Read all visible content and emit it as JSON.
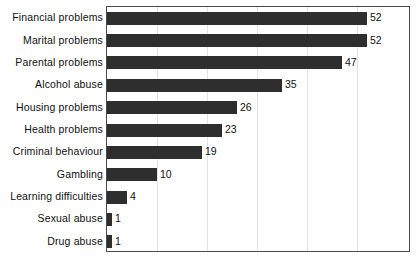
{
  "chart_data": {
    "type": "bar",
    "orientation": "horizontal",
    "title": "",
    "xlabel": "",
    "ylabel": "",
    "xlim": [
      0,
      60
    ],
    "grid": true,
    "grid_axis": "x",
    "grid_interval": 10,
    "legend": "none",
    "show_value_labels": true,
    "show_tick_labels": false,
    "categories": [
      "Financial problems",
      "Marital problems",
      "Parental problems",
      "Alcohol abuse",
      "Housing problems",
      "Health problems",
      "Criminal behaviour",
      "Gambling",
      "Learning difficulties",
      "Sexual abuse",
      "Drug abuse"
    ],
    "values": [
      52,
      52,
      47,
      35,
      26,
      23,
      19,
      10,
      4,
      1,
      1
    ],
    "value_labels": [
      "52",
      "52",
      "47",
      "35",
      "26",
      "23",
      "19",
      "10",
      "4",
      "1",
      "1"
    ],
    "colors": {
      "bar": "#2e2e2e",
      "frame": "#4a4a4a",
      "gridline": "#e2e2e2",
      "background": "#ffffff",
      "text": "#111111"
    }
  }
}
